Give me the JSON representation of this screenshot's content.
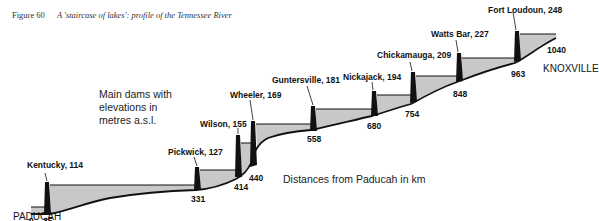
{
  "figure": {
    "number": "Figure 60",
    "caption": "A 'staircase of lakes': profile of the Tennessee River"
  },
  "notes": {
    "legend_line1": "Main dams with",
    "legend_line2": "elevations in",
    "legend_line3": "metres a.s.l.",
    "distances": "Distances from Paducah in km"
  },
  "places": {
    "start": "PADUCAH",
    "end": "KNOXVILLE"
  },
  "dams": [
    {
      "name": "Kentucky",
      "elevation": 114,
      "label": "Kentucky, 114",
      "km": 35,
      "km_label": "35"
    },
    {
      "name": "Pickwick",
      "elevation": 127,
      "label": "Pickwick, 127",
      "km": 331,
      "km_label": "331"
    },
    {
      "name": "Wilson",
      "elevation": 155,
      "label": "Wilson, 155",
      "km": 414,
      "km_label": "414"
    },
    {
      "name": "Wheeler",
      "elevation": 169,
      "label": "Wheeler, 169",
      "km": 440,
      "km_label": "440"
    },
    {
      "name": "Guntersville",
      "elevation": 181,
      "label": "Guntersville, 181",
      "km": 558,
      "km_label": "558"
    },
    {
      "name": "Nickajack",
      "elevation": 194,
      "label": "Nickajack, 194",
      "km": 680,
      "km_label": "680"
    },
    {
      "name": "Chickamauga",
      "elevation": 209,
      "label": "Chickamauga, 209",
      "km": 754,
      "km_label": "754"
    },
    {
      "name": "Watts Bar",
      "elevation": 227,
      "label": "Watts Bar, 227",
      "km": 848,
      "km_label": "848"
    },
    {
      "name": "Fort Loudoun",
      "elevation": 248,
      "label": "Fort Loudoun, 248",
      "km": 963,
      "km_label": "963"
    }
  ],
  "distance_marks": {
    "start_km": "0",
    "end_km": "1040"
  },
  "colors": {
    "water": "#c8c8c8",
    "dam": "#111111",
    "line": "#111111"
  }
}
